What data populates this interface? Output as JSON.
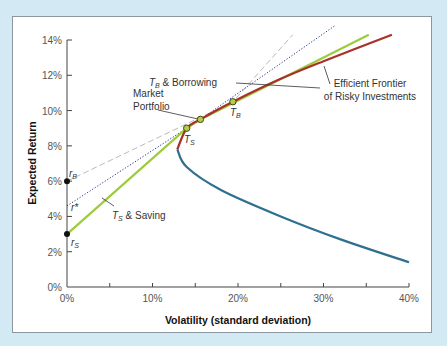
{
  "chart_data": {
    "type": "line",
    "title": "",
    "xlabel": "Volatility (standard deviation)",
    "ylabel": "Expected Return",
    "xlim": [
      0,
      40
    ],
    "ylim": [
      0,
      14
    ],
    "x_ticks": [
      "0%",
      "10%",
      "20%",
      "30%",
      "40%"
    ],
    "y_ticks": [
      "0%",
      "2%",
      "4%",
      "6%",
      "8%",
      "10%",
      "12%",
      "14%"
    ],
    "grid": false,
    "series": [
      {
        "name": "Efficient Frontier of Risky Investments (upper)",
        "color": "#a8322a",
        "points": [
          [
            12.9,
            7.8
          ],
          [
            14.0,
            9.0
          ],
          [
            15.6,
            9.5
          ],
          [
            19.4,
            10.5
          ],
          [
            25,
            11.8
          ],
          [
            30,
            12.8
          ],
          [
            38,
            14.3
          ]
        ]
      },
      {
        "name": "Inefficient portfolios (lower branch)",
        "color": "#2f6f8f",
        "points": [
          [
            12.9,
            7.8
          ],
          [
            14,
            6.8
          ],
          [
            18,
            5.5
          ],
          [
            25,
            4.0
          ],
          [
            32,
            2.7
          ],
          [
            40,
            1.4
          ]
        ]
      },
      {
        "name": "T_S & Saving",
        "color": "#9ccc3c",
        "style": "solid",
        "points": [
          [
            0,
            3.0
          ],
          [
            14.0,
            9.0
          ],
          [
            15.6,
            9.5
          ],
          [
            35.3,
            14.3
          ]
        ]
      },
      {
        "name": "T_B & Borrowing line (from r_B)",
        "color": "#bbbbbb",
        "style": "dashed",
        "points": [
          [
            0,
            6.0
          ],
          [
            19.4,
            10.5
          ],
          [
            26.4,
            14.3
          ]
        ]
      },
      {
        "name": "Line through r*",
        "color": "#223388",
        "style": "dotted",
        "points": [
          [
            0,
            4.6
          ],
          [
            15.6,
            9.5
          ],
          [
            31.3,
            14.8
          ]
        ]
      }
    ],
    "points": [
      {
        "label": "r_B",
        "x": 0,
        "y": 6.0
      },
      {
        "label": "r*",
        "x": 0,
        "y": 4.6
      },
      {
        "label": "r_S",
        "x": 0,
        "y": 3.0
      },
      {
        "label": "T_S",
        "x": 14.0,
        "y": 9.0
      },
      {
        "label": "Market Portfolio",
        "x": 15.6,
        "y": 9.5
      },
      {
        "label": "T_B",
        "x": 19.4,
        "y": 10.5
      }
    ],
    "annotations": [
      "T_B & Borrowing",
      "Market Portfolio",
      "Efficient Frontier of Risky Investments",
      "T_S & Saving",
      "T_S",
      "T_B",
      "r_B",
      "r*",
      "r_S"
    ]
  },
  "labels": {
    "xlabel": "Volatility (standard deviation)",
    "ylabel": "Expected Return",
    "tb_borrowing_a": "T",
    "tb_borrowing_sub": "B",
    "tb_borrowing_b": " & Borrowing",
    "ts_saving_a": "T",
    "ts_saving_sub": "S",
    "ts_saving_b": " & Saving",
    "market_1": "Market",
    "market_2": "Portfolio",
    "frontier_1": "Efficient Frontier",
    "frontier_2": "of Risky Investments",
    "tb": "T",
    "tb_sub": "B",
    "ts": "T",
    "ts_sub": "S",
    "rb": "r",
    "rb_sub": "B",
    "rstar": "r*",
    "rs": "r",
    "rs_sub": "S"
  },
  "x_ticks": [
    "0%",
    "10%",
    "20%",
    "30%",
    "40%"
  ],
  "y_ticks": [
    "0%",
    "2%",
    "4%",
    "6%",
    "8%",
    "10%",
    "12%",
    "14%"
  ]
}
